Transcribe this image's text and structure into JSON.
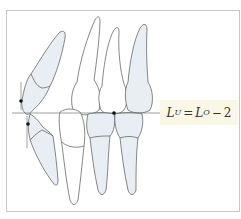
{
  "diagram": {
    "type": "dental-occlusion",
    "label": {
      "lhs_var": "L",
      "lhs_sub": "U",
      "equals": "=",
      "rhs_var": "L",
      "rhs_sub": "O",
      "minus": "−",
      "constant": "2"
    },
    "colors": {
      "tooth_fill_shaded": "#e8eef3",
      "tooth_fill_plain": "#ffffff",
      "outline": "#555555",
      "occlusal_line": "#777777",
      "label_background": "#fbf7e6",
      "frame_border": "#c8c8c8",
      "marker": "#111111"
    }
  }
}
